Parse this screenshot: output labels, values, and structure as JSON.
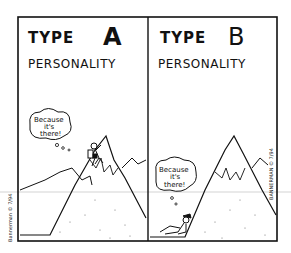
{
  "comic": {
    "panels": [
      {
        "title_line1_prefix": "TYPE",
        "title_line1_letter": "A",
        "title_line2": "PERSONALITY",
        "thought_bubble": [
          "Because",
          "it's",
          "there!"
        ],
        "scene": "climber scaling mountain"
      },
      {
        "title_line1_prefix": "TYPE",
        "title_line1_letter": "B",
        "title_line2": "PERSONALITY",
        "thought_bubble": [
          "Because",
          "it's",
          "there!"
        ],
        "scene": "person lounging at base of mountain"
      }
    ],
    "signature_left": "Bannerman © 7/94",
    "signature_right": "BANNERMAN © 7/94"
  },
  "colors": {
    "ink": "#111111",
    "paper": "#ffffff",
    "scan_line": "#c8c8c8"
  }
}
